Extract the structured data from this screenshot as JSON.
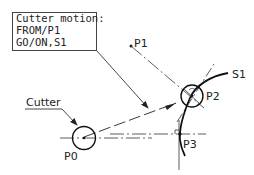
{
  "caption_box": {
    "lines": [
      "Cutter motion:",
      "FROM/P1",
      "GO/ON,S1"
    ]
  },
  "labels": {
    "cutter": "Cutter",
    "p0": "P0",
    "p1": "P1",
    "p2": "P2",
    "p3": "P3",
    "s1": "S1"
  },
  "colors": {
    "stroke": "#222222",
    "background": "#ffffff"
  }
}
